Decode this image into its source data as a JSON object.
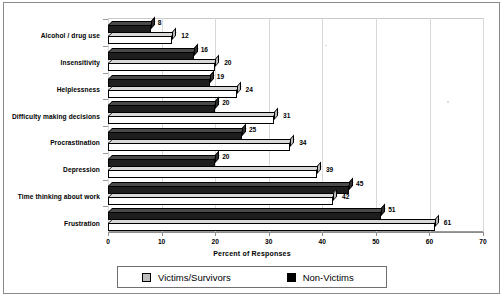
{
  "chart_data": {
    "type": "bar",
    "orientation": "horizontal",
    "style": "3d-clustered-bar",
    "title": "",
    "subtitle": "",
    "xlabel": "Percent of Responses",
    "ylabel": "",
    "xlim": [
      0,
      70
    ],
    "xticks": [
      0,
      10,
      20,
      30,
      40,
      50,
      60,
      70
    ],
    "grid": true,
    "legend_position": "bottom",
    "categories": [
      "Alcohol / drug use",
      "Insensitivity",
      "Helplessness",
      "Difficulty making decisions",
      "Procrastination",
      "Depression",
      "Time thinking about work",
      "Frustration"
    ],
    "series": [
      {
        "name": "Victims/Survivors",
        "color": "#ffffff",
        "values": [
          12,
          20,
          24,
          31,
          34,
          39,
          42,
          61
        ]
      },
      {
        "name": "Non-Victims",
        "color": "#1d1d1d",
        "values": [
          8,
          16,
          19,
          20,
          25,
          20,
          45,
          51
        ]
      }
    ]
  },
  "axis": {
    "x_title": "Percent of Responses",
    "x_tick_labels": [
      "0",
      "10",
      "20",
      "30",
      "40",
      "50",
      "60",
      "70"
    ],
    "y_tick_labels": [
      "Alcohol / drug use",
      "Insensitivity",
      "Helplessness",
      "Difficulty making decisions",
      "Procrastination",
      "Depression",
      "Time thinking about work",
      "Frustration"
    ]
  },
  "value_labels": {
    "victims": [
      "12",
      "20",
      "24",
      "31",
      "34",
      "39",
      "42",
      "61"
    ],
    "nonvictims": [
      "8",
      "16",
      "19",
      "20",
      "25",
      "20",
      "45",
      "51"
    ]
  },
  "legend": {
    "items": [
      {
        "label": "Victims/Survivors",
        "swatch": "light"
      },
      {
        "label": "Non-Victims",
        "swatch": "dark"
      }
    ]
  }
}
